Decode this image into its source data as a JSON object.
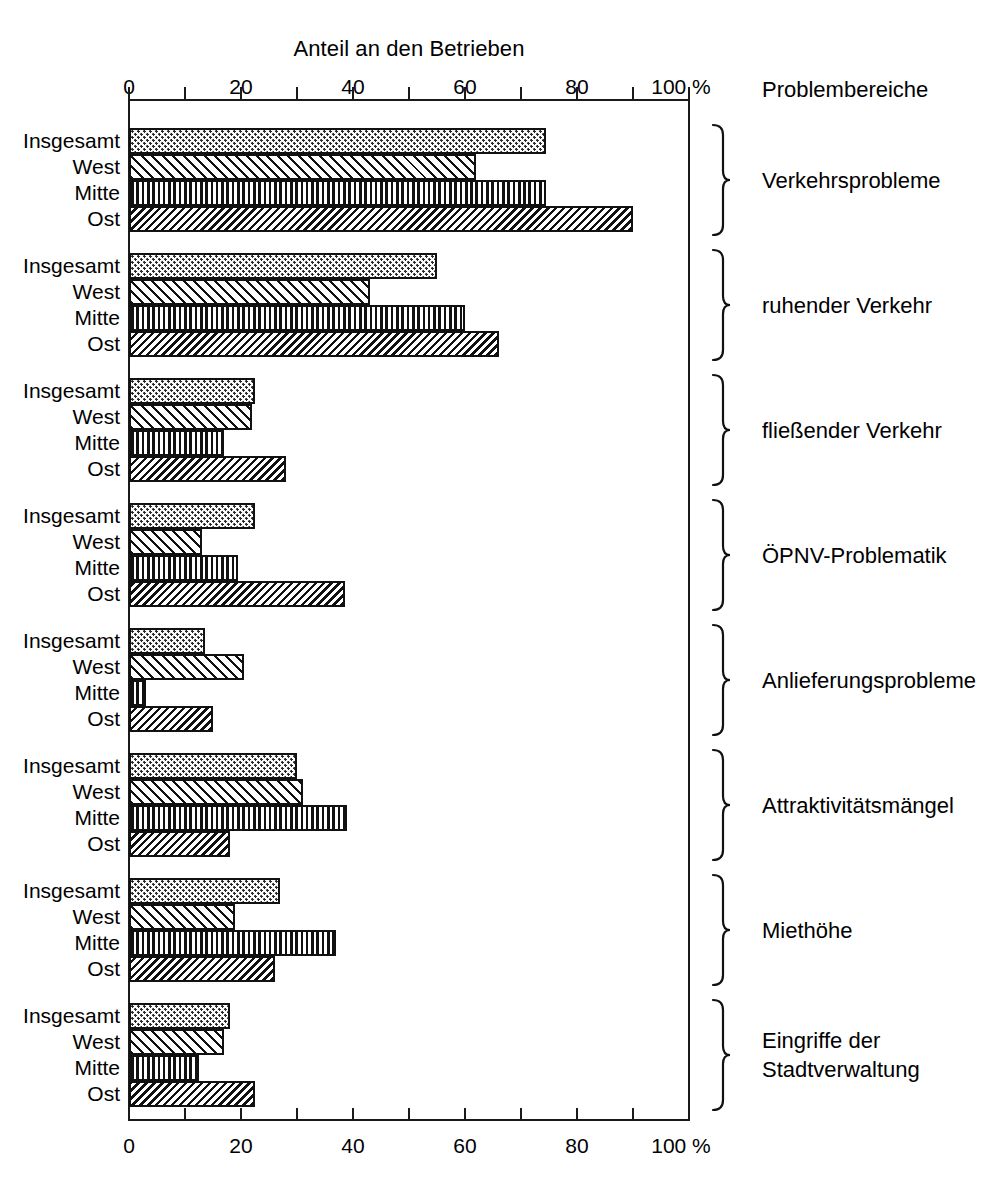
{
  "chart_title": "Anteil an den Betrieben",
  "right_header": "Problembereiche",
  "axis": {
    "tick_labels": [
      "0",
      "20",
      "40",
      "60",
      "80",
      "100"
    ],
    "tick_values": [
      0,
      20,
      40,
      60,
      80,
      100
    ],
    "minor_tick_values": [
      0,
      10,
      20,
      30,
      40,
      50,
      60,
      70,
      80,
      90,
      100
    ],
    "unit": "%",
    "min": 0,
    "max": 100
  },
  "series_labels": [
    "Insgesamt",
    "West",
    "Mitte",
    "Ost"
  ],
  "chart_data": {
    "type": "bar",
    "orientation": "horizontal",
    "title": "Anteil an den Betrieben",
    "xlabel": "%",
    "ylabel": "Problembereiche",
    "xlim": [
      0,
      100
    ],
    "grid": false,
    "legend_position": "none",
    "categories": [
      "Verkehrsprobleme",
      "ruhender Verkehr",
      "fließender Verkehr",
      "ÖPNV-Problematik",
      "Anlieferungsprobleme",
      "Attraktivitätsmängel",
      "Miethöhe",
      "Eingriffe der Stadtverwaltung"
    ],
    "series": [
      {
        "name": "Insgesamt",
        "pattern": "dots",
        "values": [
          74.5,
          55.0,
          22.5,
          22.5,
          13.5,
          30.0,
          27.0,
          18.0
        ]
      },
      {
        "name": "West",
        "pattern": "diag-light",
        "values": [
          62.0,
          43.0,
          22.0,
          13.0,
          20.5,
          31.0,
          19.0,
          17.0
        ]
      },
      {
        "name": "Mitte",
        "pattern": "vertical",
        "values": [
          74.5,
          60.0,
          17.0,
          19.5,
          3.0,
          39.0,
          37.0,
          12.5
        ]
      },
      {
        "name": "Ost",
        "pattern": "diag-dense",
        "values": [
          90.0,
          66.0,
          28.0,
          38.5,
          15.0,
          18.0,
          26.0,
          22.5
        ]
      }
    ]
  },
  "category_labels": [
    {
      "lines": [
        "Verkehrsprobleme"
      ]
    },
    {
      "lines": [
        "ruhender Verkehr"
      ]
    },
    {
      "lines": [
        "fließender Verkehr"
      ]
    },
    {
      "lines": [
        "ÖPNV-Problematik"
      ]
    },
    {
      "lines": [
        "Anlieferungsprobleme"
      ]
    },
    {
      "lines": [
        "Attraktivitätsmängel"
      ]
    },
    {
      "lines": [
        "Miethöhe"
      ]
    },
    {
      "lines": [
        "Eingriffe der",
        "Stadtverwaltung"
      ]
    }
  ],
  "colors": {
    "ink": "#111111",
    "background": "#ffffff"
  }
}
